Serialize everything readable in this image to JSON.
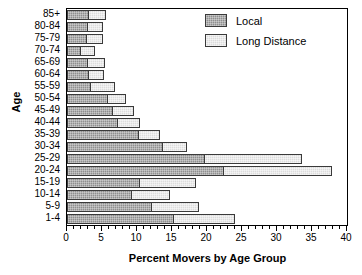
{
  "chart_data": {
    "type": "bar",
    "orientation": "horizontal",
    "stacked": true,
    "title": "",
    "xlabel": "Percent Movers by Age Group",
    "ylabel": "Age",
    "xlim": [
      0,
      40
    ],
    "xticks": [
      0,
      5,
      10,
      15,
      20,
      25,
      30,
      35,
      40
    ],
    "xtick_labels": [
      "0",
      "5",
      "10",
      "15",
      "20",
      "25",
      "30",
      "35",
      "40"
    ],
    "minor_tick_step": 1,
    "grid": false,
    "legend_position": "top-right",
    "categories": [
      "85+",
      "80-84",
      "75-79",
      "70-74",
      "65-69",
      "60-64",
      "55-59",
      "50-54",
      "45-49",
      "40-44",
      "35-39",
      "30-34",
      "25-29",
      "20-24",
      "15-19",
      "10-14",
      "5-9",
      "1-4"
    ],
    "series": [
      {
        "name": "Local",
        "color": "#8f8f8f",
        "values": [
          3.2,
          3.0,
          2.8,
          2.0,
          3.0,
          3.1,
          3.4,
          5.9,
          6.6,
          7.3,
          10.3,
          13.7,
          19.7,
          22.4,
          10.4,
          9.3,
          12.2,
          15.3
        ]
      },
      {
        "name": "Long Distance",
        "color": "#dcdcdc",
        "values": [
          2.4,
          2.2,
          2.4,
          2.0,
          2.4,
          2.2,
          3.4,
          2.6,
          3.0,
          3.1,
          3.0,
          3.5,
          13.9,
          15.5,
          8.1,
          5.4,
          6.6,
          8.7
        ]
      }
    ],
    "totals": [
      5.6,
      5.2,
      5.2,
      4.0,
      5.4,
      5.3,
      6.8,
      8.5,
      9.6,
      10.4,
      13.3,
      17.2,
      33.6,
      37.9,
      18.5,
      14.7,
      18.8,
      24.0
    ]
  },
  "legend": {
    "items": [
      {
        "label": "Local"
      },
      {
        "label": "Long Distance"
      }
    ]
  },
  "axes": {
    "x_title": "Percent Movers by Age Group",
    "y_title": "Age"
  }
}
